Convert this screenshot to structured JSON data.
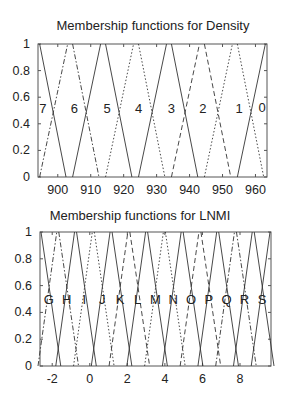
{
  "chart_data": [
    {
      "type": "line",
      "title": "Membership functions for Density",
      "xlabel": "",
      "ylabel": "",
      "xlim": [
        894,
        963.5
      ],
      "ylim": [
        0,
        1
      ],
      "xticks": [
        "900",
        "910",
        "920",
        "930",
        "940",
        "950",
        "960"
      ],
      "yticks": [
        "0",
        "0.2",
        "0.4",
        "0.6",
        "0.8",
        "1"
      ],
      "grid": false,
      "legend": "none",
      "set_labels": [
        {
          "text": "7",
          "x": 895.5,
          "y": 0.52
        },
        {
          "text": "6",
          "x": 905,
          "y": 0.52
        },
        {
          "text": "5",
          "x": 915,
          "y": 0.52
        },
        {
          "text": "4",
          "x": 924.5,
          "y": 0.52
        },
        {
          "text": "3",
          "x": 934.5,
          "y": 0.52
        },
        {
          "text": "2",
          "x": 944,
          "y": 0.52
        },
        {
          "text": "1",
          "x": 955,
          "y": 0.52
        },
        {
          "text": "0",
          "x": 962,
          "y": 0.53
        }
      ],
      "segments": [
        {
          "style": "solid",
          "x": [
            894.5,
            902.5
          ],
          "y": [
            1,
            0
          ]
        },
        {
          "style": "dashdot",
          "x": [
            894.5,
            903
          ],
          "y": [
            0,
            1
          ]
        },
        {
          "style": "dashdot",
          "x": [
            904.5,
            912.5
          ],
          "y": [
            1,
            0
          ]
        },
        {
          "style": "solid",
          "x": [
            904.5,
            913
          ],
          "y": [
            0,
            1
          ]
        },
        {
          "style": "solid",
          "x": [
            914.5,
            922.5
          ],
          "y": [
            1,
            0
          ]
        },
        {
          "style": "dotted",
          "x": [
            914.5,
            923
          ],
          "y": [
            0,
            1
          ]
        },
        {
          "style": "dotted",
          "x": [
            924.5,
            932.5
          ],
          "y": [
            1,
            0
          ]
        },
        {
          "style": "solid",
          "x": [
            924.5,
            933
          ],
          "y": [
            0,
            1
          ]
        },
        {
          "style": "solid",
          "x": [
            934.5,
            942.5
          ],
          "y": [
            1,
            0
          ]
        },
        {
          "style": "dashed",
          "x": [
            934.5,
            943
          ],
          "y": [
            0,
            1
          ]
        },
        {
          "style": "dashed",
          "x": [
            944.5,
            952.5
          ],
          "y": [
            1,
            0
          ]
        },
        {
          "style": "dotted",
          "x": [
            944.5,
            953
          ],
          "y": [
            0,
            1
          ]
        },
        {
          "style": "dotted",
          "x": [
            954.5,
            962.5
          ],
          "y": [
            1,
            0
          ]
        },
        {
          "style": "solid",
          "x": [
            954.5,
            963
          ],
          "y": [
            0,
            1
          ]
        }
      ]
    },
    {
      "type": "line",
      "title": "Membership functions for LNMI",
      "xlabel": "",
      "ylabel": "",
      "xlim": [
        -2.65,
        9.65
      ],
      "ylim": [
        0,
        1
      ],
      "xticks": [
        "-2",
        "0",
        "2",
        "4",
        "6",
        "8"
      ],
      "yticks": [
        "0",
        "0.2",
        "0.4",
        "0.6",
        "0.8",
        "1"
      ],
      "grid": false,
      "legend": "none",
      "set_labels": [
        "G",
        "H",
        "I",
        "J",
        "K",
        "L",
        "M",
        "N",
        "O",
        "P",
        "Q",
        "R",
        "S"
      ]
    }
  ]
}
